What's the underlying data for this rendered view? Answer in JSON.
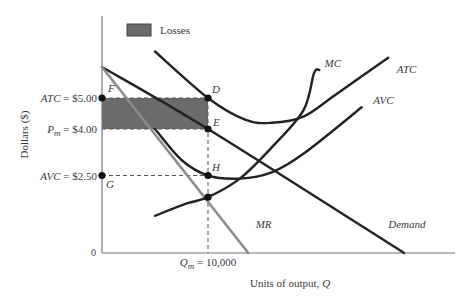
{
  "chart_data": {
    "type": "line",
    "title": "",
    "xlabel": "Units of output, Q",
    "ylabel": "Dollars ($)",
    "origin_label": "0",
    "x_tick": {
      "label": "Q_m = 10,000",
      "value": 10000
    },
    "xlim": [
      0,
      33000
    ],
    "ylim": [
      0,
      7.7
    ],
    "grid": false,
    "legend": {
      "position": "top-left",
      "entries": [
        {
          "label": "Losses",
          "color": "#6b6b6b"
        }
      ]
    },
    "y_ticks": [
      {
        "label": "ATC = $5.00",
        "value": 5.0
      },
      {
        "label": "P_m = $4.00",
        "value": 4.0
      },
      {
        "label": "AVC = $2.50",
        "value": 2.5
      }
    ],
    "series": [
      {
        "name": "Demand",
        "color": "#222222",
        "points": [
          [
            0,
            6.0
          ],
          [
            10000,
            4.0
          ],
          [
            28500,
            0
          ]
        ]
      },
      {
        "name": "MR",
        "color": "#8c8c8c",
        "points": [
          [
            0,
            6.0
          ],
          [
            13800,
            0
          ]
        ]
      },
      {
        "name": "ATC",
        "color": "#222222",
        "points": [
          [
            5000,
            6.5
          ],
          [
            10000,
            5.0
          ],
          [
            13500,
            4.3
          ],
          [
            16000,
            4.2
          ],
          [
            19000,
            4.4
          ],
          [
            22000,
            5.1
          ],
          [
            27000,
            6.3
          ]
        ]
      },
      {
        "name": "AVC",
        "color": "#222222",
        "points": [
          [
            5000,
            4.0
          ],
          [
            7500,
            3.0
          ],
          [
            10000,
            2.5
          ],
          [
            13000,
            2.4
          ],
          [
            16000,
            2.6
          ],
          [
            19000,
            3.2
          ],
          [
            24500,
            4.7
          ]
        ]
      },
      {
        "name": "MC",
        "color": "#222222",
        "points": [
          [
            5000,
            1.2
          ],
          [
            8000,
            1.6
          ],
          [
            10000,
            1.8
          ],
          [
            13000,
            2.4
          ],
          [
            16000,
            3.4
          ],
          [
            19000,
            4.6
          ],
          [
            20000,
            5.8
          ],
          [
            20500,
            5.9
          ]
        ]
      }
    ],
    "points": [
      {
        "label": "F",
        "x": 0,
        "y": 5.0
      },
      {
        "label": "D",
        "x": 10000,
        "y": 5.0
      },
      {
        "label": "E",
        "x": 10000,
        "y": 4.0
      },
      {
        "label": "G",
        "x": 0,
        "y": 2.5
      },
      {
        "label": "H",
        "x": 10000,
        "y": 2.5
      },
      {
        "label": "",
        "x": 10000,
        "y": 1.8
      }
    ],
    "shaded_region": {
      "label": "Losses",
      "x": [
        0,
        10000
      ],
      "y": [
        4.0,
        5.0
      ],
      "color": "#6b6b6b"
    },
    "curve_labels": [
      {
        "label": "MC",
        "x": 21000,
        "y": 6.0
      },
      {
        "label": "ATC",
        "x": 27800,
        "y": 5.8
      },
      {
        "label": "AVC",
        "x": 25600,
        "y": 4.8
      },
      {
        "label": "MR",
        "x": 14500,
        "y": 0.8
      },
      {
        "label": "Demand",
        "x": 27000,
        "y": 0.8
      }
    ]
  }
}
